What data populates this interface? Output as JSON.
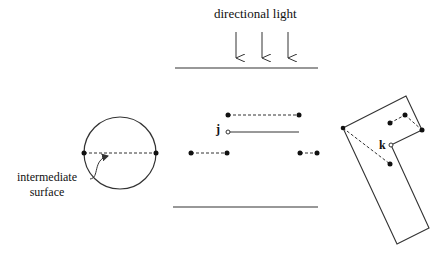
{
  "figure": {
    "title": "directional light",
    "labels": {
      "intermediate_line1": "intermediate",
      "intermediate_line2": "surface",
      "point_j": "j",
      "point_k": "k"
    },
    "colors": {
      "stroke": "#333333",
      "background": "#ffffff"
    }
  }
}
